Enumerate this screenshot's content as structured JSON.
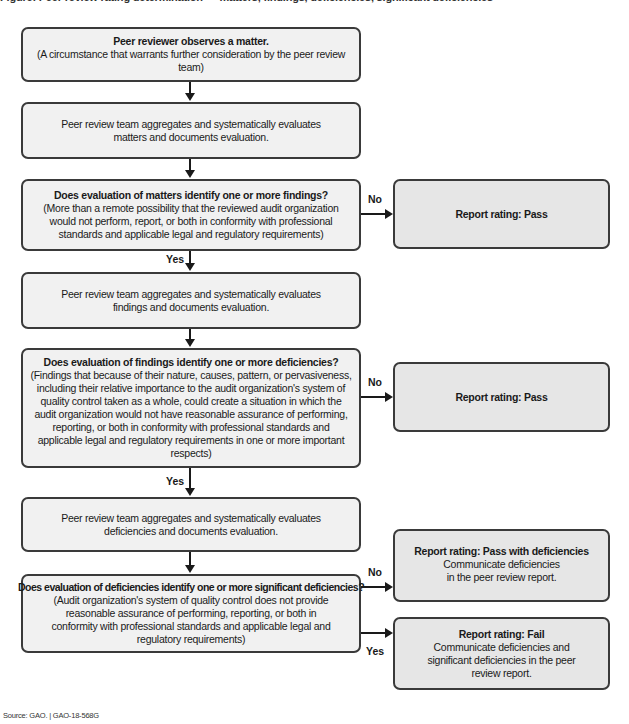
{
  "header": {
    "cutoff_text": "Figure: Peer review rating determination — matters, findings, deficiencies, significant deficiencies"
  },
  "boxes": {
    "observe": {
      "title": "Peer reviewer observes a matter.",
      "body": "(A circumstance that warrants further consideration by the peer review team)"
    },
    "eval_matters": {
      "body": "Peer review team aggregates and systematically evaluates matters and documents evaluation."
    },
    "q_findings": {
      "title": "Does evaluation of matters identify one or more findings?",
      "body": "(More than a remote possibility that the reviewed audit organization would not perform, report, or both in conformity with professional standards and applicable legal and regulatory requirements)"
    },
    "eval_findings": {
      "body": "Peer review team aggregates and systematically evaluates findings and documents evaluation."
    },
    "q_deficiencies": {
      "title": "Does evaluation of findings identify one or more deficiencies?",
      "body": "(Findings that because of their nature, causes, pattern, or pervasiveness, including their relative importance to the audit organization's system of quality control taken as a whole, could create a situation in which the audit organization would not have reasonable assurance of performing, reporting, or both in conformity with professional standards and applicable legal and regulatory requirements in one or more important respects)"
    },
    "eval_deficiencies": {
      "body": "Peer review team aggregates and systematically evaluates deficiencies and documents evaluation."
    },
    "q_significant": {
      "title": "Does evaluation of deficiencies identify one or more significant deficiencies?",
      "body": "(Audit organization's system of quality control does not provide reasonable assurance of performing, reporting, or both in conformity with professional standards and applicable legal and regulatory requirements)"
    },
    "rating_pass_1": {
      "title": "Report rating: Pass"
    },
    "rating_pass_2": {
      "title": "Report rating: Pass"
    },
    "rating_pass_with_def": {
      "title": "Report rating: Pass with deficiencies",
      "line1": "Communicate deficiencies",
      "line2": "in the peer review report."
    },
    "rating_fail": {
      "title": "Report rating: Fail",
      "body": "Communicate deficiencies and significant deficiencies in the peer review report."
    }
  },
  "labels": {
    "no": "No",
    "yes": "Yes"
  },
  "footer": {
    "source": "Source: GAO.  |  GAO-18-568G"
  },
  "colors": {
    "box_fill": "#f1f1f1",
    "outcome_fill": "#e6e6e6",
    "border": "#3a3a3a",
    "arrow": "#1a1a1a"
  }
}
